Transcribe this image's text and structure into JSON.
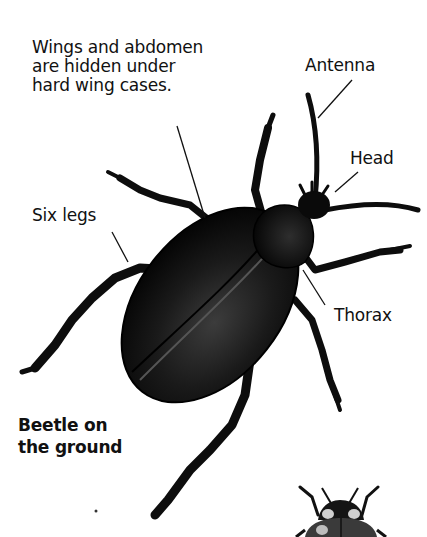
{
  "diagram": {
    "subject": "beetle",
    "labels": {
      "wings": "Wings and abdomen\nare hidden under\nhard wing cases.",
      "antenna": "Antenna",
      "head": "Head",
      "legs": "Six legs",
      "thorax": "Thorax",
      "caption": "Beetle on\nthe ground"
    },
    "colors": {
      "background": "#ffffff",
      "text": "#111111",
      "beetle_body": "#0d0d0d",
      "beetle_highlight": "#3a3a3a",
      "leader_line": "#111111"
    },
    "inset": {
      "subject": "ladybird",
      "position": "bottom-right"
    }
  }
}
